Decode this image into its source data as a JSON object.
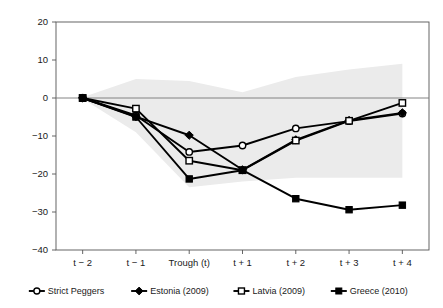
{
  "chart_data": {
    "type": "line",
    "title": "",
    "subtitle": "",
    "xlabel": "",
    "ylabel": "",
    "categories": [
      "t − 2",
      "t − 1",
      "Trough (t)",
      "t + 1",
      "t + 2",
      "t + 3",
      "t + 4"
    ],
    "ylim": [
      -40,
      20
    ],
    "ytick_labels": [
      "20",
      "10",
      "0",
      "−10",
      "−20",
      "−30",
      "−40"
    ],
    "ytick_values": [
      20,
      10,
      0,
      -10,
      -20,
      -30,
      -40
    ],
    "grid": false,
    "zero_line": true,
    "legend_position": "bottom",
    "series": [
      {
        "name": "Strict Peggers",
        "marker": "open-circle",
        "color": "#000000",
        "values": [
          0,
          -4.6,
          -14.2,
          -12.5,
          -8.0,
          -6.1,
          -4.1
        ]
      },
      {
        "name": "Estonia (2009)",
        "marker": "filled-diamond",
        "color": "#000000",
        "values": [
          0,
          -4.9,
          -9.8,
          -18.9,
          -11.0,
          -5.9,
          -3.9
        ]
      },
      {
        "name": "Latvia (2009)",
        "marker": "open-square",
        "color": "#000000",
        "values": [
          0,
          -2.8,
          -16.5,
          -19.0,
          -11.2,
          -6.0,
          -1.3
        ]
      },
      {
        "name": "Greece (2010)",
        "marker": "filled-square",
        "color": "#000000",
        "values": [
          0,
          -5.0,
          -21.3,
          -19.0,
          -26.5,
          -29.4,
          -28.2
        ]
      }
    ],
    "confidence_band": {
      "label": "shaded range",
      "color": "#ebebeb",
      "upper": [
        0.2,
        5.0,
        4.5,
        1.5,
        5.5,
        7.5,
        9.0
      ],
      "lower": [
        -0.2,
        -9.0,
        -23.5,
        -22.0,
        -21.0,
        -21.0,
        -21.0
      ]
    }
  },
  "legend": {
    "items": [
      {
        "label": "Strict Peggers",
        "marker": "open-circle"
      },
      {
        "label": "Estonia (2009)",
        "marker": "filled-diamond"
      },
      {
        "label": "Latvia (2009)",
        "marker": "open-square"
      },
      {
        "label": "Greece (2010)",
        "marker": "filled-square"
      }
    ]
  }
}
